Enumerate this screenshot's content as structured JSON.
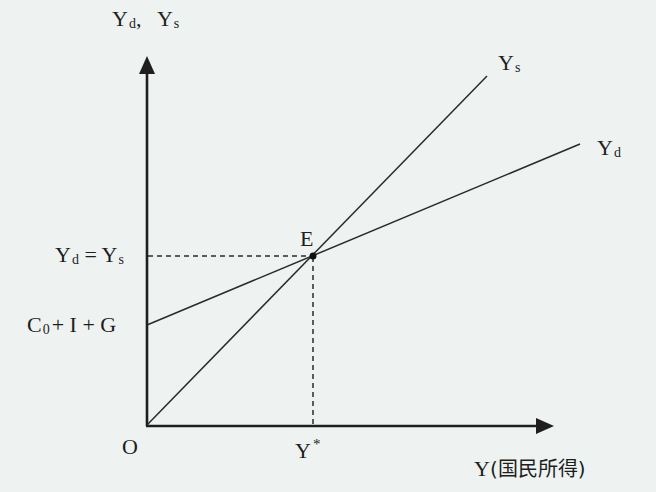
{
  "diagram": {
    "colors": {
      "background": "#eef3f1",
      "ink": "#1e1e1e"
    },
    "y_axis_label": {
      "main1": "Y",
      "sub1": "d",
      "sep": ",",
      "main2": "Y",
      "sub2": "s"
    },
    "x_axis_label": {
      "main": "Y",
      "paren": "(国民所得)"
    },
    "origin_label": "O",
    "lines": {
      "supply": {
        "label_main": "Y",
        "label_sub": "s",
        "from": [
          147,
          425
        ],
        "to": [
          487,
          76
        ]
      },
      "demand": {
        "label_main": "Y",
        "label_sub": "d",
        "from": [
          147,
          325
        ],
        "to": [
          580,
          145
        ]
      }
    },
    "equilibrium": {
      "point_label": "E",
      "point": [
        313,
        256
      ],
      "y_label": {
        "m1": "Y",
        "s1": "d",
        "eq": " = ",
        "m2": "Y",
        "s2": "s"
      },
      "x_label": {
        "main": "Y",
        "sup": "*"
      }
    },
    "intercept_label": {
      "c": "C",
      "sub": "0",
      "rest": "+ I + G"
    }
  }
}
